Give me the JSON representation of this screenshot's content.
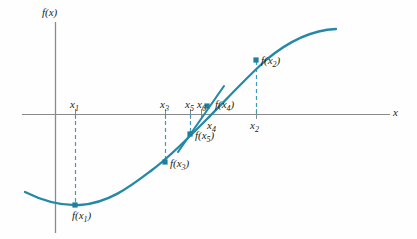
{
  "figure": {
    "type": "math-graph",
    "colors": {
      "curve": "#2488a6",
      "marker": "#1f7e9c",
      "dashed": "#3e9cb5",
      "axis": "#8a8a8a",
      "text": "#231f20",
      "background": "#fefefe"
    },
    "axes": {
      "y_axis_label": "f(x)",
      "x_axis_label": "x",
      "x_axis_y_px": 114,
      "y_axis_x_px": 55,
      "x_axis_from_px": 22,
      "x_axis_to_px": 390,
      "y_axis_from_px": 22,
      "y_axis_to_px": 233
    },
    "tick_labels": [
      {
        "name": "x1",
        "base": "x",
        "sub": "1",
        "x_px": 75,
        "y_px": 99,
        "side": "above"
      },
      {
        "name": "x3",
        "base": "x",
        "sub": "3",
        "x_px": 165,
        "y_px": 99,
        "side": "above"
      },
      {
        "name": "x5",
        "base": "x",
        "sub": "5",
        "x_px": 190,
        "y_px": 99,
        "side": "above"
      },
      {
        "name": "x6",
        "base": "x",
        "sub": "6",
        "x_px": 202,
        "y_px": 99,
        "side": "above"
      },
      {
        "name": "x4",
        "base": "x",
        "sub": "4",
        "x_px": 212,
        "y_px": 120,
        "side": "below"
      },
      {
        "name": "x2",
        "base": "x",
        "sub": "2",
        "x_px": 255,
        "y_px": 120,
        "side": "below"
      }
    ],
    "point_labels": [
      {
        "name": "f(x1)",
        "base": "f(x",
        "sub": "1",
        "close": ")",
        "x_px": 72,
        "y_px": 210
      },
      {
        "name": "f(x3)",
        "base": "f(x",
        "sub": "3",
        "close": ")",
        "x_px": 170,
        "y_px": 158
      },
      {
        "name": "f(x5)",
        "base": "f(x",
        "sub": "5",
        "close": ")",
        "x_px": 195,
        "y_px": 130
      },
      {
        "name": "f(x4)",
        "base": "f(x",
        "sub": "4",
        "close": ")",
        "x_px": 215,
        "y_px": 99
      },
      {
        "name": "f(x2)",
        "base": "f(x",
        "sub": "2",
        "close": ")",
        "x_px": 261,
        "y_px": 55
      }
    ],
    "markers": [
      {
        "name": "point-f-x1",
        "cx": 75,
        "cy": 205,
        "shape": "square"
      },
      {
        "name": "point-f-x3",
        "cx": 165,
        "cy": 162,
        "shape": "square"
      },
      {
        "name": "point-f-x5",
        "cx": 190,
        "cy": 134,
        "shape": "square"
      },
      {
        "name": "point-f-x4",
        "cx": 207,
        "cy": 106,
        "shape": "square"
      },
      {
        "name": "point-f-x2",
        "cx": 256,
        "cy": 60,
        "shape": "square"
      }
    ],
    "dashed_droplines": [
      {
        "name": "dropline-x1",
        "x": 75,
        "y1": 114,
        "y2": 205
      },
      {
        "name": "dropline-x3",
        "x": 165,
        "y1": 114,
        "y2": 162
      },
      {
        "name": "dropline-x5",
        "x": 190,
        "y1": 114,
        "y2": 134
      },
      {
        "name": "dropline-x2",
        "x": 256,
        "y1": 114,
        "y2": 60
      }
    ],
    "axis_ticks": [
      {
        "name": "tick-x1",
        "x": 75,
        "y1": 109,
        "y2": 119
      },
      {
        "name": "tick-x3",
        "x": 165,
        "y1": 109,
        "y2": 119
      },
      {
        "name": "tick-x5",
        "x": 190,
        "y1": 109,
        "y2": 119
      },
      {
        "name": "tick-x6",
        "x": 201,
        "y1": 109,
        "y2": 119
      },
      {
        "name": "tick-x2",
        "x": 256,
        "y1": 109,
        "y2": 119
      }
    ],
    "secant_line": {
      "name": "secant-x5-x4",
      "x1": 178,
      "y1": 152,
      "x2": 224,
      "y2": 86
    },
    "curve_path": "M 25,192 C 45,202 62,206 80,205 C 110,203 132,185 152,170 C 172,155 188,138 206,120 C 224,102 244,80 266,60 C 290,40 312,30 336,29"
  }
}
